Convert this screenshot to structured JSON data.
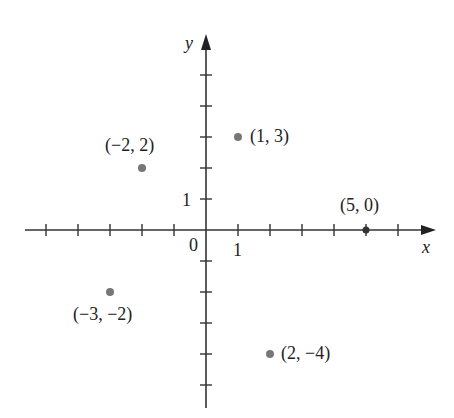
{
  "chart_data": {
    "type": "scatter",
    "title": "",
    "xlabel": "x",
    "ylabel": "y",
    "xlim": [
      -5.5,
      7
    ],
    "ylim": [
      -5,
      6
    ],
    "grid": false,
    "tick_labels": {
      "origin": "0",
      "x_one": "1",
      "y_one": "1"
    },
    "points": [
      {
        "x": -2,
        "y": 2,
        "label": "(−2, 2)"
      },
      {
        "x": 1,
        "y": 3,
        "label": "(1, 3)"
      },
      {
        "x": 5,
        "y": 0,
        "label": "(5, 0)"
      },
      {
        "x": -3,
        "y": -2,
        "label": "(−3, −2)"
      },
      {
        "x": 2,
        "y": -4,
        "label": "(2, −4)"
      }
    ],
    "point_color": "#777777",
    "axis_color": "#333333"
  }
}
